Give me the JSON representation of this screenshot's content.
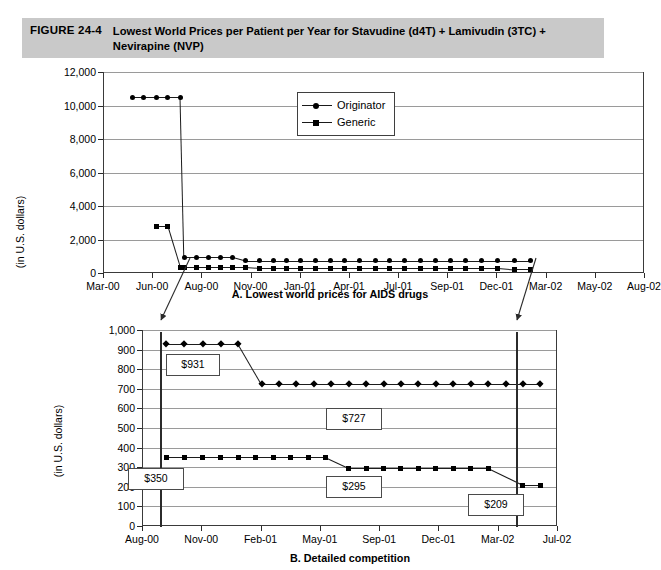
{
  "figure": {
    "number": "FIGURE 24-4",
    "title": "Lowest World Prices per Patient per Year for Stavudine (d4T) + Lamivudin (3TC) + Nevirapine (NVP)",
    "banner_color": "#c9c9c9"
  },
  "legend": {
    "position": "inside-top-center",
    "entries": [
      {
        "label": "Originator",
        "marker": "circle",
        "icon": "circle-marker-icon",
        "color": "#000000"
      },
      {
        "label": "Generic",
        "marker": "square",
        "icon": "square-marker-icon",
        "color": "#000000"
      }
    ]
  },
  "chart_data": [
    {
      "id": "panel-a",
      "type": "line",
      "title": "A. Lowest world prices for AIDS drugs",
      "xlabel": "",
      "ylabel": "(in U.S. dollars)",
      "ylim": [
        0,
        12000
      ],
      "ytick_step": 2000,
      "ytick_labels": [
        "0",
        "2,000",
        "4,000",
        "6,000",
        "8,000",
        "10,000",
        "12,000"
      ],
      "ytick_values": [
        0,
        2000,
        4000,
        6000,
        8000,
        10000,
        12000
      ],
      "grid": true,
      "x_axis_type": "date",
      "xlim": [
        "Mar-00",
        "Aug-02"
      ],
      "tick_labels": [
        "Mar-00",
        "Jun-00",
        "Aug-00",
        "Nov-00",
        "Jan-01",
        "Apr-01",
        "Jul-01",
        "Sep-01",
        "Dec-01",
        "Mar-02",
        "May-02",
        "Aug-02"
      ],
      "series": [
        {
          "name": "Originator",
          "marker": "circle",
          "x": [
            0.055,
            0.075,
            0.098,
            0.12,
            0.143,
            0.15,
            0.172,
            0.195,
            0.218,
            0.24,
            0.263,
            0.29,
            0.315,
            0.34,
            0.365,
            0.393,
            0.42,
            0.447,
            0.475,
            0.503,
            0.53,
            0.558,
            0.586,
            0.614,
            0.642,
            0.67,
            0.7,
            0.73,
            0.76,
            0.79
          ],
          "values": [
            10500,
            10500,
            10500,
            10500,
            10500,
            931,
            931,
            931,
            931,
            931,
            727,
            727,
            727,
            727,
            727,
            727,
            727,
            727,
            727,
            727,
            727,
            727,
            727,
            727,
            727,
            727,
            727,
            727,
            727,
            727
          ]
        },
        {
          "name": "Generic",
          "marker": "square",
          "x": [
            0.098,
            0.12,
            0.143,
            0.15,
            0.172,
            0.195,
            0.218,
            0.24,
            0.263,
            0.29,
            0.315,
            0.34,
            0.365,
            0.393,
            0.42,
            0.447,
            0.475,
            0.503,
            0.53,
            0.558,
            0.586,
            0.614,
            0.642,
            0.67,
            0.7,
            0.73,
            0.76,
            0.79
          ],
          "values": [
            2800,
            2800,
            350,
            350,
            350,
            350,
            350,
            350,
            350,
            295,
            295,
            295,
            295,
            295,
            295,
            295,
            295,
            295,
            295,
            295,
            295,
            295,
            295,
            295,
            295,
            295,
            209,
            209
          ]
        }
      ],
      "annotations": []
    },
    {
      "id": "panel-b",
      "type": "line",
      "title": "B. Detailed competition",
      "xlabel": "",
      "ylabel": "(in U.S. dollars)",
      "ylim": [
        0,
        1000
      ],
      "ytick_step": 100,
      "ytick_labels": [
        "0",
        "100",
        "200",
        "300",
        "400",
        "500",
        "600",
        "700",
        "800",
        "900",
        "1,000"
      ],
      "ytick_values": [
        0,
        100,
        200,
        300,
        400,
        500,
        600,
        700,
        800,
        900,
        1000
      ],
      "grid": true,
      "x_axis_type": "date",
      "xlim": [
        "Aug-00",
        "Jul-02"
      ],
      "tick_labels": [
        "Aug-00",
        "Nov-00",
        "Feb-01",
        "May-01",
        "Sep-01",
        "Dec-01",
        "Mar-02",
        "Jul-02"
      ],
      "series": [
        {
          "name": "Originator",
          "marker": "diamond",
          "x": [
            0.058,
            0.102,
            0.146,
            0.19,
            0.232,
            0.288,
            0.33,
            0.372,
            0.414,
            0.456,
            0.498,
            0.54,
            0.582,
            0.624,
            0.666,
            0.708,
            0.75,
            0.792,
            0.834,
            0.876,
            0.918,
            0.96
          ],
          "values": [
            931,
            931,
            931,
            931,
            931,
            727,
            727,
            727,
            727,
            727,
            727,
            727,
            727,
            727,
            727,
            727,
            727,
            727,
            727,
            727,
            727,
            727
          ]
        },
        {
          "name": "Generic",
          "marker": "square",
          "x": [
            0.058,
            0.102,
            0.146,
            0.19,
            0.232,
            0.274,
            0.316,
            0.358,
            0.4,
            0.442,
            0.498,
            0.54,
            0.582,
            0.624,
            0.666,
            0.708,
            0.75,
            0.792,
            0.834,
            0.918,
            0.96
          ],
          "values": [
            350,
            350,
            350,
            350,
            350,
            350,
            350,
            350,
            350,
            350,
            295,
            295,
            295,
            295,
            295,
            295,
            295,
            295,
            295,
            209,
            209
          ]
        }
      ],
      "annotations": [
        {
          "label": "$931",
          "value": 931,
          "series": "Originator"
        },
        {
          "label": "$727",
          "value": 727,
          "series": "Originator"
        },
        {
          "label": "$350",
          "value": 350,
          "series": "Generic"
        },
        {
          "label": "$295",
          "value": 295,
          "series": "Generic"
        },
        {
          "label": "$209",
          "value": 209,
          "series": "Generic"
        }
      ]
    }
  ]
}
